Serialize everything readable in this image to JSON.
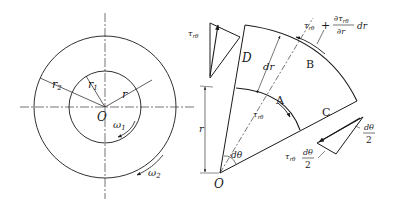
{
  "figure_left": {
    "center_label": "O",
    "r1_label": "r",
    "r1_sub": "1",
    "r2_label": "r",
    "r2_sub": "2",
    "r_label": "r",
    "omega1_label": "ω",
    "omega1_sub": "1",
    "omega2_label": "ω",
    "omega2_sub": "2"
  },
  "figure_right": {
    "origin_label": "O",
    "point_a": "A",
    "point_b": "B",
    "point_c": "C",
    "point_d": "D",
    "dr_label": "dr",
    "r_label": "r",
    "dtheta_label": "dθ",
    "tau": "τ",
    "tau_sub": "rθ",
    "plus": "+",
    "partial_num": "∂τ",
    "partial_num_sub": "rθ",
    "partial_den": "∂r",
    "partial_dr": "dr",
    "frac_num": "dθ",
    "frac_den": "2"
  },
  "colors": {
    "ink": "#1a1a1a",
    "background": "#ffffff"
  }
}
